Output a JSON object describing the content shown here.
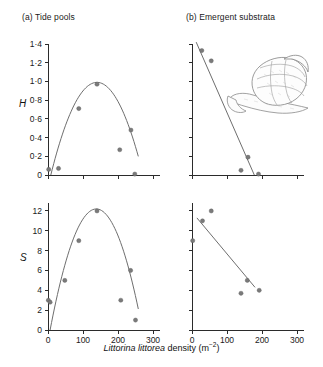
{
  "figure": {
    "xcaption_species": "Littorina littorea",
    "xcaption_rest": " density (m",
    "xcaption_sup": "−2",
    "xcaption_close": ")",
    "illustration": "littorina-littorea-snail"
  },
  "panels": {
    "a": {
      "title": "(a) Tide pools"
    },
    "b": {
      "title": "(b) Emergent substrata"
    }
  },
  "axes": {
    "h_label": "H",
    "s_label": "S",
    "h_ticks": [
      "0",
      "0·2",
      "0·4",
      "0·6",
      "0·8",
      "1·0",
      "1·2",
      "1·4"
    ],
    "s_ticks": [
      "0",
      "2",
      "4",
      "6",
      "8",
      "10",
      "12"
    ],
    "x_ticks": [
      "0",
      "100",
      "200",
      "300"
    ]
  },
  "chart_data": [
    {
      "type": "scatter",
      "id": "panel-a-H",
      "title": "(a) Tide pools",
      "xlabel": "Littorina littorea density (m-2)",
      "ylabel": "H",
      "xlim": [
        0,
        320
      ],
      "ylim": [
        0,
        1.4
      ],
      "xticks": [
        0,
        100,
        200,
        300
      ],
      "xticklabels": [
        "",
        "",
        "",
        ""
      ],
      "yticks": [
        0,
        0.2,
        0.4,
        0.6,
        0.8,
        1.0,
        1.2,
        1.4
      ],
      "yticklabels": [
        "0",
        "0·2",
        "0·4",
        "0·6",
        "0·8",
        "1·0",
        "1·2",
        "1·4"
      ],
      "grid": false,
      "legend": false,
      "points": [
        {
          "x": 2,
          "y": 0.06
        },
        {
          "x": 30,
          "y": 0.07
        },
        {
          "x": 88,
          "y": 0.71
        },
        {
          "x": 140,
          "y": 0.97
        },
        {
          "x": 205,
          "y": 0.27
        },
        {
          "x": 237,
          "y": 0.48
        },
        {
          "x": 248,
          "y": 0.01
        }
      ],
      "fit": {
        "kind": "quadratic-hump",
        "peak_x": 140,
        "peak_y": 0.99,
        "x_start": 8,
        "x_end": 258
      }
    },
    {
      "type": "scatter",
      "id": "panel-b-H",
      "title": "(b) Emergent substrata",
      "xlabel": "Littorina littorea density (m-2)",
      "ylabel": "H",
      "xlim": [
        0,
        320
      ],
      "ylim": [
        0,
        1.4
      ],
      "xticks": [
        0,
        100,
        200,
        300
      ],
      "xticklabels": [
        "",
        "",
        "",
        ""
      ],
      "yticks": [
        0,
        0.2,
        0.4,
        0.6,
        0.8,
        1.0,
        1.2,
        1.4
      ],
      "yticklabels": [
        "",
        "",
        "",
        "",
        "",
        "",
        "",
        ""
      ],
      "grid": false,
      "legend": false,
      "points": [
        {
          "x": 28,
          "y": 1.33
        },
        {
          "x": 55,
          "y": 1.22
        },
        {
          "x": 140,
          "y": 0.05
        },
        {
          "x": 160,
          "y": 0.19
        },
        {
          "x": 190,
          "y": 0.01
        }
      ],
      "fit": {
        "kind": "linear",
        "x_start": 12,
        "y_start": 1.42,
        "x_end": 178,
        "y_end": 0.0
      }
    },
    {
      "type": "scatter",
      "id": "panel-a-S",
      "title": "(a) Tide pools",
      "xlabel": "Littorina littorea density (m-2)",
      "ylabel": "S",
      "xlim": [
        0,
        320
      ],
      "ylim": [
        0,
        12.8
      ],
      "xticks": [
        0,
        100,
        200,
        300
      ],
      "xticklabels": [
        "0",
        "100",
        "200",
        "300"
      ],
      "yticks": [
        0,
        2,
        4,
        6,
        8,
        10,
        12
      ],
      "yticklabels": [
        "0",
        "2",
        "4",
        "6",
        "8",
        "10",
        "12"
      ],
      "grid": false,
      "legend": false,
      "points": [
        {
          "x": 1,
          "y": 3.0
        },
        {
          "x": 6,
          "y": 2.8
        },
        {
          "x": 48,
          "y": 5.0
        },
        {
          "x": 88,
          "y": 9.0
        },
        {
          "x": 140,
          "y": 12.0
        },
        {
          "x": 208,
          "y": 3.0
        },
        {
          "x": 236,
          "y": 6.0
        },
        {
          "x": 250,
          "y": 1.0
        }
      ],
      "fit": {
        "kind": "quadratic-hump",
        "peak_x": 138,
        "peak_y": 12.2,
        "x_start": 6,
        "x_end": 258
      }
    },
    {
      "type": "scatter",
      "id": "panel-b-S",
      "title": "(b) Emergent substrata",
      "xlabel": "Littorina littorea density (m-2)",
      "ylabel": "S",
      "xlim": [
        0,
        320
      ],
      "ylim": [
        0,
        12.8
      ],
      "xticks": [
        0,
        100,
        200,
        300
      ],
      "xticklabels": [
        "0",
        "100",
        "200",
        "300"
      ],
      "yticks": [
        0,
        2,
        4,
        6,
        8,
        10,
        12
      ],
      "yticklabels": [
        "",
        "",
        "",
        "",
        "",
        "",
        ""
      ],
      "grid": false,
      "legend": false,
      "points": [
        {
          "x": 2,
          "y": 9.0
        },
        {
          "x": 30,
          "y": 11.0
        },
        {
          "x": 55,
          "y": 12.0
        },
        {
          "x": 140,
          "y": 3.7
        },
        {
          "x": 158,
          "y": 5.0
        },
        {
          "x": 192,
          "y": 4.0
        }
      ],
      "fit": {
        "kind": "linear",
        "x_start": 14,
        "y_start": 11.3,
        "x_end": 180,
        "y_end": 4.3
      }
    }
  ]
}
